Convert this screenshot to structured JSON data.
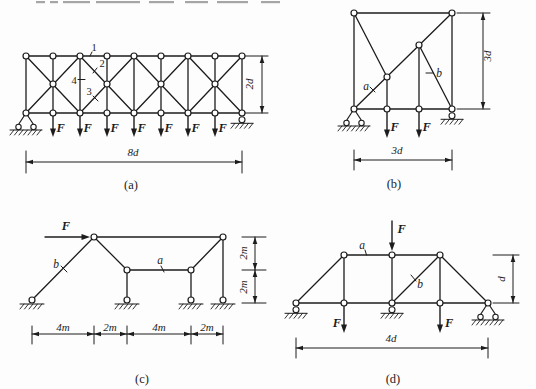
{
  "ink": "#1c1c1c",
  "bg": "#fdfdfd",
  "top_fragments": [
    {
      "x": 36,
      "w": 9
    },
    {
      "x": 50,
      "w": 8
    },
    {
      "x": 63,
      "w": 27
    },
    {
      "x": 96,
      "w": 44
    },
    {
      "x": 149,
      "w": 25
    },
    {
      "x": 185,
      "w": 23
    },
    {
      "x": 217,
      "w": 31
    },
    {
      "x": 261,
      "w": 19
    }
  ],
  "figures": [
    {
      "id": "a",
      "caption": "(a)",
      "caption_pos": [
        131,
        193
      ],
      "members": [
        [
          26,
          56,
          242,
          56
        ],
        [
          26,
          113,
          242,
          113
        ],
        [
          26,
          56,
          26,
          113
        ],
        [
          53,
          56,
          53,
          113
        ],
        [
          80,
          56,
          80,
          113
        ],
        [
          107,
          56,
          107,
          113
        ],
        [
          134,
          56,
          134,
          113
        ],
        [
          161,
          56,
          161,
          113
        ],
        [
          188,
          56,
          188,
          113
        ],
        [
          215,
          56,
          215,
          113
        ],
        [
          242,
          56,
          242,
          113
        ],
        [
          26,
          56,
          80,
          113
        ],
        [
          26,
          113,
          80,
          56
        ],
        [
          80,
          56,
          134,
          113
        ],
        [
          80,
          113,
          134,
          56
        ],
        [
          134,
          56,
          188,
          113
        ],
        [
          134,
          113,
          188,
          56
        ],
        [
          188,
          56,
          242,
          113
        ],
        [
          188,
          113,
          242,
          56
        ]
      ],
      "joints": [
        [
          26,
          56
        ],
        [
          53,
          56
        ],
        [
          80,
          56
        ],
        [
          107,
          56
        ],
        [
          134,
          56
        ],
        [
          161,
          56
        ],
        [
          188,
          56
        ],
        [
          215,
          56
        ],
        [
          242,
          56
        ],
        [
          26,
          113
        ],
        [
          53,
          113
        ],
        [
          80,
          113
        ],
        [
          107,
          113
        ],
        [
          134,
          113
        ],
        [
          161,
          113
        ],
        [
          188,
          113
        ],
        [
          215,
          113
        ],
        [
          242,
          113
        ],
        [
          53,
          84
        ],
        [
          107,
          84
        ],
        [
          161,
          84
        ],
        [
          215,
          84
        ]
      ],
      "supports": [
        {
          "type": "pin",
          "x": 26,
          "y": 113
        },
        {
          "type": "roller",
          "x": 242,
          "y": 113
        }
      ],
      "loads": [
        {
          "x1": 53,
          "y1": 114,
          "x2": 53,
          "y2": 137,
          "label": "F",
          "lx": 56.5,
          "ly": 131.5,
          "anchor": "start"
        },
        {
          "x1": 80,
          "y1": 114,
          "x2": 80,
          "y2": 137,
          "label": "F",
          "lx": 83.5,
          "ly": 131.5,
          "anchor": "start"
        },
        {
          "x1": 107,
          "y1": 114,
          "x2": 107,
          "y2": 137,
          "label": "F",
          "lx": 110.5,
          "ly": 131.5,
          "anchor": "start"
        },
        {
          "x1": 134,
          "y1": 114,
          "x2": 134,
          "y2": 137,
          "label": "F",
          "lx": 137.5,
          "ly": 131.5,
          "anchor": "start"
        },
        {
          "x1": 161,
          "y1": 114,
          "x2": 161,
          "y2": 137,
          "label": "F",
          "lx": 164.5,
          "ly": 131.5,
          "anchor": "start"
        },
        {
          "x1": 188,
          "y1": 114,
          "x2": 188,
          "y2": 137,
          "label": "F",
          "lx": 191.5,
          "ly": 131.5,
          "anchor": "start"
        },
        {
          "x1": 215,
          "y1": 114,
          "x2": 215,
          "y2": 137,
          "label": "F",
          "lx": 218.5,
          "ly": 131.5,
          "anchor": "start"
        }
      ],
      "part_labels": [
        {
          "text": "1",
          "x": 94,
          "y": 51,
          "italic": false,
          "tick": [
            92,
            52,
            90,
            56
          ]
        },
        {
          "text": "2",
          "x": 102,
          "y": 67,
          "italic": false,
          "tick": [
            97,
            68,
            93,
            73
          ]
        },
        {
          "text": "4",
          "x": 74,
          "y": 84,
          "italic": false,
          "tick": [
            78,
            79.5,
            85,
            79.5
          ]
        },
        {
          "text": "3",
          "x": 89,
          "y": 95,
          "italic": false,
          "tick": [
            93,
            96,
            98,
            101
          ]
        }
      ],
      "dims": [
        {
          "orient": "h",
          "line": 162,
          "ticks": [
            26,
            242
          ],
          "tick_span": [
            151,
            173
          ],
          "segments": [
            {
              "a": 26,
              "b": 242,
              "label": "8d",
              "lx": 133,
              "ly": 156
            }
          ]
        },
        {
          "orient": "v",
          "line": 262,
          "ticks": [
            56,
            113
          ],
          "tick_span": [
            245,
            268
          ],
          "segments": [
            {
              "a": 56,
              "b": 113,
              "label": "2d",
              "lx": 253,
              "ly": 84
            }
          ]
        }
      ]
    },
    {
      "id": "b",
      "caption": "(b)",
      "caption_pos": [
        394,
        192
      ],
      "members": [
        [
          354,
          13,
          452,
          13
        ],
        [
          354,
          13,
          354,
          109
        ],
        [
          452,
          13,
          452,
          109
        ],
        [
          354,
          109,
          452,
          109
        ],
        [
          354,
          109,
          452,
          13
        ],
        [
          354,
          13,
          387,
          77
        ],
        [
          387,
          77,
          387,
          109
        ],
        [
          419,
          45,
          419,
          109
        ],
        [
          419,
          45,
          452,
          109
        ]
      ],
      "joints": [
        [
          354,
          13
        ],
        [
          452,
          13
        ],
        [
          354,
          109
        ],
        [
          387,
          109
        ],
        [
          419,
          109
        ],
        [
          452,
          109
        ],
        [
          387,
          77
        ],
        [
          419,
          45
        ]
      ],
      "supports": [
        {
          "type": "pin",
          "x": 354,
          "y": 109
        },
        {
          "type": "roller",
          "x": 452,
          "y": 109
        }
      ],
      "loads": [
        {
          "x1": 387,
          "y1": 110,
          "x2": 387,
          "y2": 138,
          "label": "F",
          "lx": 390.5,
          "ly": 131,
          "anchor": "start"
        },
        {
          "x1": 419,
          "y1": 110,
          "x2": 419,
          "y2": 138,
          "label": "F",
          "lx": 422.5,
          "ly": 131,
          "anchor": "start"
        }
      ],
      "part_labels": [
        {
          "text": "a",
          "x": 366,
          "y": 90,
          "italic": true,
          "tick": [
            370,
            87,
            375,
            92
          ]
        },
        {
          "text": "b",
          "x": 439,
          "y": 77,
          "italic": true,
          "tick": [
            426,
            73,
            433,
            73
          ]
        }
      ],
      "dims": [
        {
          "orient": "h",
          "line": 160,
          "ticks": [
            354,
            452
          ],
          "tick_span": [
            150,
            170
          ],
          "segments": [
            {
              "a": 354,
              "b": 452,
              "label": "3d",
              "lx": 397,
              "ly": 154
            }
          ]
        },
        {
          "orient": "v",
          "line": 483,
          "ticks": [
            13,
            109
          ],
          "tick_span": [
            457,
            490
          ],
          "segments": [
            {
              "a": 13,
              "b": 109,
              "label": "3d",
              "lx": 491,
              "ly": 56
            }
          ]
        }
      ]
    },
    {
      "id": "c",
      "caption": "(c)",
      "caption_pos": [
        142,
        387
      ],
      "members": [
        [
          32,
          300,
          94,
          237
        ],
        [
          94,
          237,
          223,
          237
        ],
        [
          94,
          237,
          127,
          270
        ],
        [
          127,
          270,
          191,
          270
        ],
        [
          191,
          270,
          223,
          237
        ],
        [
          127,
          270,
          127,
          300
        ],
        [
          191,
          270,
          191,
          300
        ],
        [
          223,
          237,
          223,
          300
        ]
      ],
      "joints": [
        [
          94,
          237
        ],
        [
          223,
          237
        ],
        [
          127,
          270
        ],
        [
          191,
          270
        ],
        [
          32,
          300
        ],
        [
          127,
          300
        ],
        [
          191,
          300
        ],
        [
          223,
          300
        ]
      ],
      "supports": [
        {
          "type": "ground",
          "x": 32,
          "y": 304
        },
        {
          "type": "ground",
          "x": 127,
          "y": 304
        },
        {
          "type": "ground",
          "x": 191,
          "y": 304
        },
        {
          "type": "ground",
          "x": 223,
          "y": 304
        }
      ],
      "loads": [
        {
          "x1": 45,
          "y1": 237,
          "x2": 90,
          "y2": 237,
          "label": "F",
          "lx": 66,
          "ly": 230,
          "anchor": "middle"
        }
      ],
      "part_labels": [
        {
          "text": "b",
          "x": 56,
          "y": 268,
          "italic": true,
          "tick": [
            61,
            266,
            67,
            272
          ]
        },
        {
          "text": "a",
          "x": 160,
          "y": 264,
          "italic": true,
          "tick": [
            161,
            266,
            164,
            272
          ]
        }
      ],
      "dims": [
        {
          "orient": "h",
          "line": 334,
          "ticks": [
            32,
            94,
            127,
            191,
            223
          ],
          "tick_span": [
            326,
            344
          ],
          "segments": [
            {
              "a": 32,
              "b": 94,
              "label": "4m",
              "lx": 63,
              "ly": 331
            },
            {
              "a": 94,
              "b": 127,
              "label": "2m",
              "lx": 110,
              "ly": 331
            },
            {
              "a": 127,
              "b": 191,
              "label": "4m",
              "lx": 159,
              "ly": 331
            },
            {
              "a": 191,
              "b": 223,
              "label": "2m",
              "lx": 207,
              "ly": 331
            }
          ]
        },
        {
          "orient": "v",
          "line": 255,
          "ticks": [
            237,
            270,
            303
          ],
          "tick_span": [
            242,
            266
          ],
          "segments": [
            {
              "a": 237,
              "b": 270,
              "label": "2m",
              "lx": 247,
              "ly": 253
            },
            {
              "a": 270,
              "b": 303,
              "label": "2m",
              "lx": 247,
              "ly": 287
            }
          ]
        }
      ]
    },
    {
      "id": "d",
      "caption": "(d)",
      "caption_pos": [
        393,
        387
      ],
      "members": [
        [
          296,
          303,
          488,
          303
        ],
        [
          344,
          255,
          440,
          255
        ],
        [
          296,
          303,
          344,
          255
        ],
        [
          440,
          255,
          488,
          303
        ],
        [
          392,
          303,
          440,
          255
        ],
        [
          344,
          255,
          344,
          303
        ],
        [
          392,
          255,
          392,
          303
        ],
        [
          440,
          255,
          440,
          303
        ]
      ],
      "joints": [
        [
          296,
          303
        ],
        [
          344,
          303
        ],
        [
          392,
          303
        ],
        [
          440,
          303
        ],
        [
          488,
          303
        ],
        [
          344,
          255
        ],
        [
          392,
          255
        ],
        [
          440,
          255
        ]
      ],
      "supports": [
        {
          "type": "roller",
          "x": 296,
          "y": 303
        },
        {
          "type": "roller",
          "x": 392,
          "y": 303
        },
        {
          "type": "pin",
          "x": 488,
          "y": 303
        }
      ],
      "loads": [
        {
          "x1": 392,
          "y1": 221,
          "x2": 392,
          "y2": 251,
          "label": "F",
          "lx": 397.5,
          "ly": 233,
          "anchor": "start"
        },
        {
          "x1": 344,
          "y1": 304,
          "x2": 344,
          "y2": 333,
          "label": "F",
          "lx": 341,
          "ly": 327,
          "anchor": "end"
        },
        {
          "x1": 440,
          "y1": 304,
          "x2": 440,
          "y2": 333,
          "label": "F",
          "lx": 445,
          "ly": 327,
          "anchor": "start"
        }
      ],
      "part_labels": [
        {
          "text": "a",
          "x": 362,
          "y": 249,
          "italic": true,
          "tick": [
            365,
            250,
            366.5,
            255
          ]
        },
        {
          "text": "b",
          "x": 420,
          "y": 288,
          "italic": true,
          "tick": [
            411,
            275,
            416,
            281
          ]
        }
      ],
      "dims": [
        {
          "orient": "h",
          "line": 348,
          "ticks": [
            296,
            488
          ],
          "tick_span": [
            338,
            358
          ],
          "segments": [
            {
              "a": 296,
              "b": 488,
              "label": "4d",
              "lx": 391,
              "ly": 342
            }
          ]
        },
        {
          "orient": "v",
          "line": 513,
          "ticks": [
            255,
            303
          ],
          "tick_span": [
            493,
            519
          ],
          "segments": [
            {
              "a": 255,
              "b": 303,
              "label": "d",
              "lx": 505,
              "ly": 279
            }
          ]
        }
      ]
    }
  ]
}
